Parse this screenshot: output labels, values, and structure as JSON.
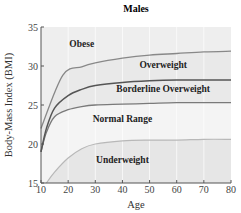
{
  "chart_data": {
    "type": "area",
    "title": "Males",
    "xlabel": "Age",
    "ylabel": "Body-Mass Index (BMI)",
    "xlim": [
      10,
      80
    ],
    "ylim": [
      15,
      35
    ],
    "xticks": [
      10,
      20,
      30,
      40,
      50,
      60,
      70,
      80
    ],
    "yticks": [
      15,
      20,
      25,
      30,
      35
    ],
    "grid": true,
    "series": [
      {
        "name": "Underweight / Normal boundary",
        "x": [
          12,
          15,
          20,
          25,
          30,
          40,
          50,
          60,
          70,
          80
        ],
        "values": [
          15,
          16.4,
          18.2,
          19.4,
          20.0,
          20.4,
          20.5,
          20.5,
          20.6,
          20.6
        ]
      },
      {
        "name": "Normal / Borderline boundary",
        "x": [
          10,
          12,
          15,
          20,
          25,
          30,
          40,
          50,
          60,
          70,
          80
        ],
        "values": [
          19.0,
          21.5,
          23.5,
          24.4,
          24.8,
          25.0,
          25.1,
          25.2,
          25.3,
          25.3,
          25.3
        ]
      },
      {
        "name": "Borderline / Overweight boundary",
        "x": [
          10,
          12,
          15,
          20,
          25,
          30,
          40,
          50,
          60,
          70,
          80
        ],
        "values": [
          19.0,
          22.0,
          24.6,
          26.2,
          27.0,
          27.5,
          27.9,
          28.1,
          28.2,
          28.2,
          28.2
        ]
      },
      {
        "name": "Overweight / Obese boundary",
        "x": [
          10,
          18,
          25,
          30,
          40,
          50,
          60,
          70,
          80
        ],
        "values": [
          22.0,
          28.8,
          29.9,
          30.4,
          31.0,
          31.4,
          31.6,
          31.8,
          31.9
        ]
      }
    ],
    "regions": [
      {
        "label": "Obese",
        "x": 25,
        "y": 32.5
      },
      {
        "label": "Overweight",
        "x": 55,
        "y": 29.8
      },
      {
        "label": "Borderline Overweight",
        "x": 55,
        "y": 26.7
      },
      {
        "label": "Normal Range",
        "x": 40,
        "y": 22.8
      },
      {
        "label": "Underweight",
        "x": 40,
        "y": 17.6
      }
    ]
  },
  "colors": {
    "underweight_fill": "#e6e6e6",
    "normal_fill": "#f4f4f4",
    "band_fill": "#e9e9e9",
    "obese_fill": "#eeeeee",
    "underweight_line": "#b8b8b8",
    "normal_line": "#7a7a7a",
    "borderline_line": "#555555",
    "obese_line": "#888888"
  }
}
